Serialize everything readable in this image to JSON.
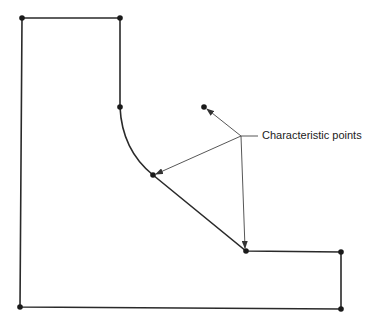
{
  "diagram": {
    "annotation": "Characteristic points",
    "colors": {
      "line": "#2a2a2a",
      "leader": "#444444",
      "text": "#222222"
    },
    "profile_points": [
      {
        "x": 22,
        "y": 18
      },
      {
        "x": 120,
        "y": 18
      },
      {
        "x": 120,
        "y": 107
      },
      {
        "x": 153,
        "y": 175
      },
      {
        "x": 246,
        "y": 251
      },
      {
        "x": 341,
        "y": 252
      },
      {
        "x": 341,
        "y": 309
      },
      {
        "x": 20,
        "y": 307
      }
    ],
    "leader_hub": {
      "x": 241,
      "y": 136
    },
    "leader_targets": [
      {
        "x": 204,
        "y": 107
      },
      {
        "x": 153,
        "y": 175
      },
      {
        "x": 246,
        "y": 251
      }
    ]
  }
}
